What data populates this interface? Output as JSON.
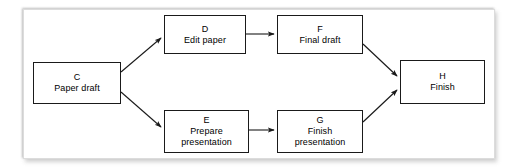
{
  "diagram": {
    "type": "activity-on-node network",
    "background_color": "#ffffff",
    "frame_border_color": "#dcdcdc",
    "node_border_color": "#1a1a1a",
    "edge_color": "#1a1a1a",
    "nodes": [
      {
        "key": "c",
        "id": "C",
        "label": "Paper draft"
      },
      {
        "key": "d",
        "id": "D",
        "label": "Edit paper"
      },
      {
        "key": "f",
        "id": "F",
        "label": "Final draft"
      },
      {
        "key": "e",
        "id": "E",
        "label": "Prepare\npresentation"
      },
      {
        "key": "g",
        "id": "G",
        "label": "Finish\npresentation"
      },
      {
        "key": "h",
        "id": "H",
        "label": "Finish"
      }
    ],
    "edges": [
      {
        "from": "C",
        "to": "D",
        "style": "diagonal-up",
        "arrowhead": "filled"
      },
      {
        "from": "C",
        "to": "E",
        "style": "diagonal-down",
        "arrowhead": "filled"
      },
      {
        "from": "D",
        "to": "F",
        "style": "horizontal",
        "arrowhead": "filled"
      },
      {
        "from": "E",
        "to": "G",
        "style": "horizontal",
        "arrowhead": "filled"
      },
      {
        "from": "F",
        "to": "H",
        "style": "diagonal-down",
        "arrowhead": "filled"
      },
      {
        "from": "G",
        "to": "H",
        "style": "diagonal-up",
        "arrowhead": "filled"
      }
    ]
  }
}
